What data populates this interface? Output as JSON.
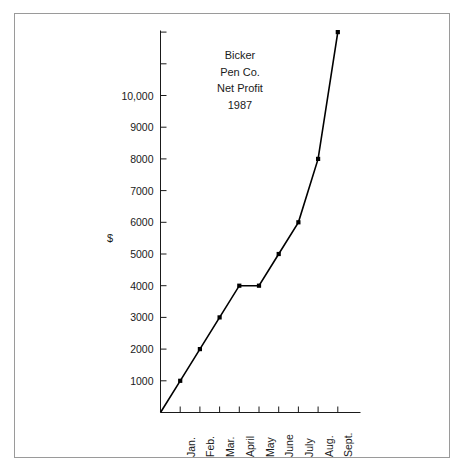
{
  "figure": {
    "border_color": "#9a9a9a",
    "background": "#ffffff",
    "axis_color": "#1a1a1a",
    "line_color": "#000000"
  },
  "title_lines": [
    "Bicker",
    "Pen Co.",
    "Net Profit",
    "1987"
  ],
  "axis": {
    "ylabel": "$"
  },
  "chart_data": {
    "type": "line",
    "title": "Bicker Pen Co. Net Profit 1987",
    "xlabel": "",
    "ylabel": "$",
    "categories": [
      "Jan.",
      "Feb.",
      "Mar.",
      "April",
      "May",
      "June",
      "July",
      "Aug.",
      "Sept."
    ],
    "values": [
      1000,
      2000,
      3000,
      4000,
      4000,
      5000,
      6000,
      8000,
      12000
    ],
    "ytick_labels": [
      "1000",
      "2000",
      "3000",
      "4000",
      "5000",
      "6000",
      "7000",
      "8000",
      "9000",
      "10,000"
    ],
    "ytick_values": [
      1000,
      2000,
      3000,
      4000,
      5000,
      6000,
      7000,
      8000,
      9000,
      10000
    ],
    "ylim": [
      0,
      12200
    ],
    "xlim": [
      0,
      10
    ],
    "grid": false,
    "legend": null,
    "markers": true,
    "marker_style": "filled-square",
    "origin_at_zero": true
  }
}
